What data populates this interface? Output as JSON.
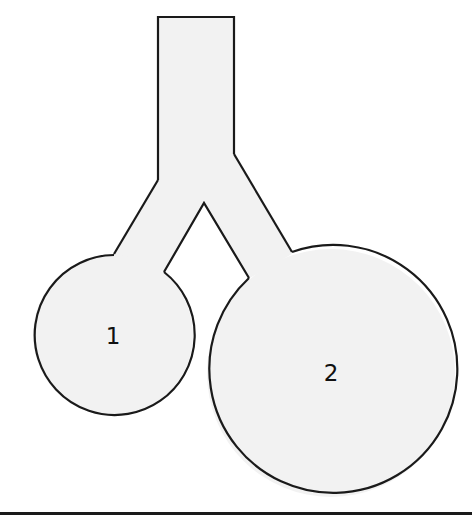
{
  "diagram": {
    "title": "",
    "colors": {
      "fill": "#f2f2f2",
      "stroke": "#1a1a1a",
      "background": "#ffffff"
    },
    "trunk": {
      "top_left": [
        158,
        17
      ],
      "top_right": [
        234,
        17
      ],
      "left_bottom": [
        158,
        180
      ],
      "right_bottom": [
        234,
        154
      ]
    },
    "branch_apex": [
      204,
      203
    ],
    "compartments": [
      {
        "id": "1",
        "label": "1",
        "cx": 113,
        "cy": 335,
        "r": 80
      },
      {
        "id": "2",
        "label": "2",
        "cx": 331,
        "cy": 373,
        "r": 124
      }
    ]
  }
}
